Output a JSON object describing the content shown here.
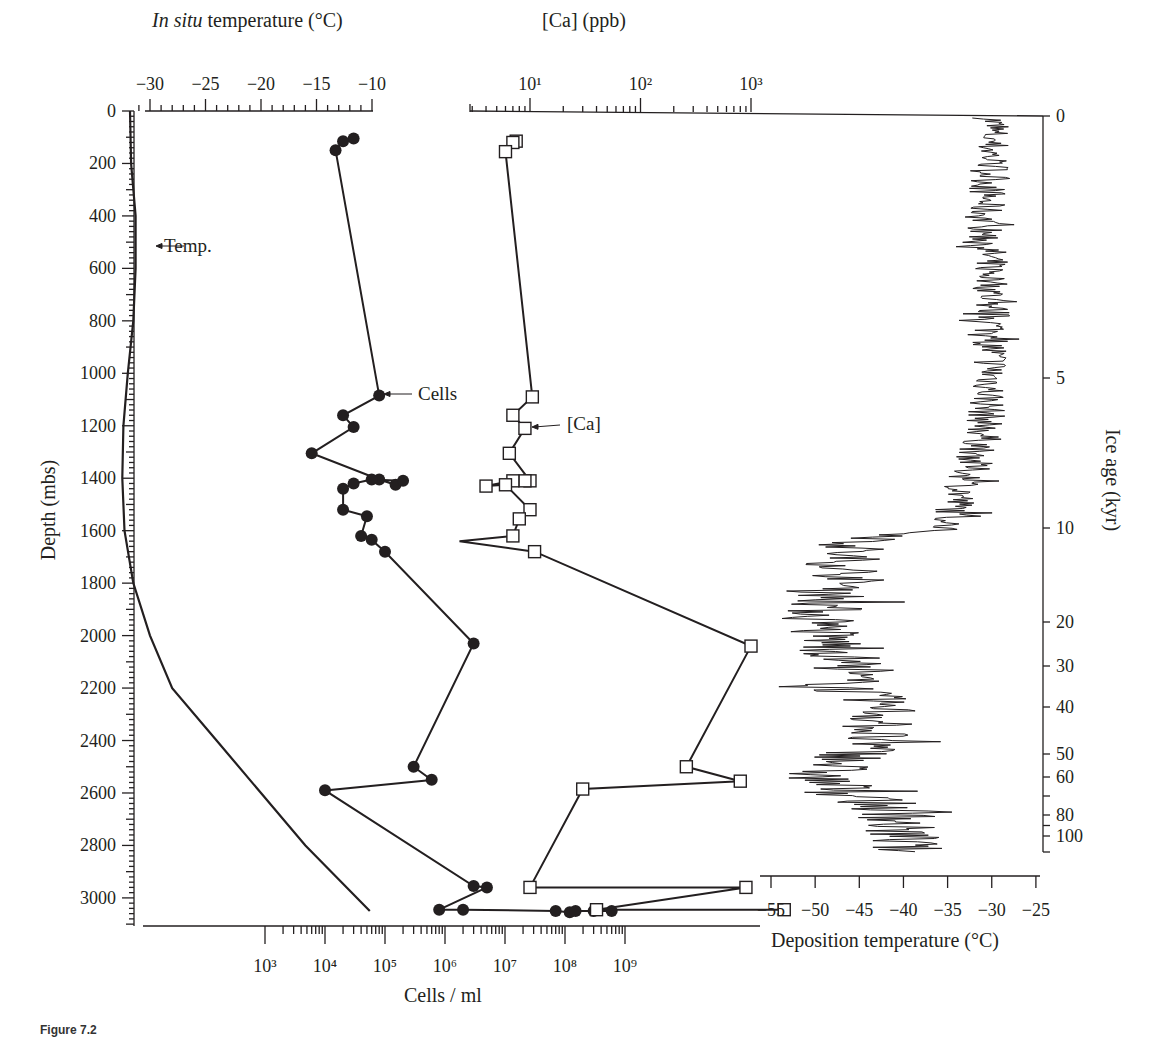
{
  "figure": {
    "caption_label": "Figure 7.2",
    "caption_text": ""
  },
  "axes": {
    "depth": {
      "label": "Depth (mbs)",
      "ticks": [
        0,
        200,
        400,
        600,
        800,
        1000,
        1200,
        1400,
        1600,
        1800,
        2000,
        2200,
        2400,
        2600,
        2800,
        3000
      ]
    },
    "insitu_temp": {
      "label_italic": "In situ",
      "label_rest": " temperature (°C)",
      "ticks": [
        "−30",
        "−25",
        "−20",
        "−15",
        "−10"
      ]
    },
    "ca": {
      "label": "[Ca] (ppb)",
      "ticks": [
        "10¹",
        "10²",
        "10³"
      ]
    },
    "cells": {
      "label": "Cells / ml",
      "ticks": [
        "10³",
        "10⁴",
        "10⁵",
        "10⁶",
        "10⁷",
        "10⁸",
        "10⁹"
      ]
    },
    "deposition_temp": {
      "label": "Deposition temperature (°C)",
      "ticks": [
        "−55",
        "−50",
        "−45",
        "−40",
        "−35",
        "−30",
        "−25"
      ]
    },
    "ice_age": {
      "label": "Ice age (kyr)",
      "ticks": [
        "0",
        "5",
        "10",
        "20",
        "30",
        "40",
        "50",
        "60",
        "80",
        "100"
      ]
    }
  },
  "annotations": {
    "temp": "Temp.",
    "cells": "Cells",
    "ca": "[Ca]"
  },
  "chart_data": [
    {
      "type": "line",
      "title": "In situ temperature vs depth",
      "xlabel": "In situ temperature (°C)",
      "ylabel": "Depth (mbs)",
      "xlim": [
        -31,
        -10
      ],
      "ylim": [
        3100,
        0
      ],
      "series": [
        {
          "name": "Temp.",
          "x": [
            -31.8,
            -31.7,
            -31.3,
            -31.3,
            -31.5,
            -32,
            -32.4,
            -32.5,
            -32.3,
            -31.5,
            -30,
            -28,
            -24,
            -20,
            -16,
            -10.2
          ],
          "y": [
            0,
            200,
            400,
            600,
            800,
            1000,
            1200,
            1400,
            1600,
            1800,
            2000,
            2200,
            2400,
            2600,
            2800,
            3050
          ]
        }
      ]
    },
    {
      "type": "line",
      "title": "Cell concentration vs depth",
      "xlabel": "Cells / ml",
      "ylabel": "Depth (mbs)",
      "xscale": "log",
      "xlim": [
        1000,
        1000000000
      ],
      "series": [
        {
          "name": "Cells",
          "x": [
            30000,
            20000,
            15000,
            80000,
            20000,
            30000,
            6000,
            80000,
            150000,
            200000,
            60000,
            30000,
            20000,
            20000,
            50000,
            40000,
            60000,
            100000,
            3000000,
            300000,
            600000,
            10000,
            3000000,
            5000000,
            800000,
            2000000,
            70000000,
            120000000,
            150000000,
            300000000,
            600000000
          ],
          "y": [
            105,
            115,
            150,
            1085,
            1160,
            1205,
            1305,
            1405,
            1425,
            1410,
            1405,
            1420,
            1440,
            1520,
            1545,
            1620,
            1635,
            1680,
            2030,
            2500,
            2550,
            2590,
            2955,
            2960,
            3045,
            3045,
            3050,
            3055,
            3050,
            3050,
            3050
          ]
        }
      ]
    },
    {
      "type": "line",
      "title": "Calcium concentration vs depth",
      "xlabel": "[Ca] (ppb)",
      "ylabel": "Depth (mbs)",
      "xscale": "log",
      "series": [
        {
          "name": "[Ca]",
          "x": [
            7.5,
            7,
            6,
            10.5,
            7,
            9,
            6.5,
            10,
            9,
            7,
            4,
            6,
            10,
            8,
            7,
            2.3,
            11,
            1000,
            260,
            800,
            30,
            10,
            900,
            40,
            2000
          ],
          "y": [
            115,
            120,
            155,
            1090,
            1160,
            1210,
            1305,
            1410,
            1410,
            1410,
            1430,
            1425,
            1520,
            1555,
            1620,
            1640,
            1680,
            2040,
            2500,
            2555,
            2585,
            2960,
            2960,
            3045,
            3045
          ]
        }
      ]
    },
    {
      "type": "line",
      "title": "Deposition temperature vs ice age",
      "xlabel": "Deposition temperature (°C)",
      "ylabel": "Ice age (kyr)",
      "xlim": [
        -55,
        -25
      ],
      "series": [
        {
          "name": "Deposition temperature",
          "x": [
            -30,
            -30,
            -31,
            -30,
            -30,
            -30,
            -31,
            -35,
            -45,
            -47,
            -46,
            -50,
            -48,
            -46,
            -47,
            -42,
            -43,
            -45,
            -50,
            -45,
            -40,
            -41,
            -40
          ],
          "y": [
            0,
            1,
            2,
            3,
            4,
            5,
            7,
            10,
            11.5,
            13,
            15,
            20,
            25,
            30,
            35,
            40,
            45,
            50,
            60,
            70,
            80,
            90,
            100
          ]
        }
      ]
    }
  ]
}
